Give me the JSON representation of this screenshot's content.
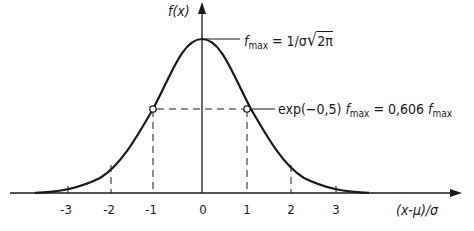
{
  "diagram": {
    "y_axis_label": "f(x)",
    "x_axis_label": "(x-μ)/σ",
    "x_ticks": [
      "-3",
      "-2",
      "-1",
      "0",
      "1",
      "2",
      "3"
    ],
    "annotations": {
      "peak": {
        "prefix": "f",
        "sub": "max",
        "rest": "= 1/σ",
        "sqrt": "2π"
      },
      "inflection": {
        "text1": "exp(−0,5)",
        "f1": "f",
        "sub1": "max",
        "mid": "= 0,606",
        "f2": "f",
        "sub2": "max"
      }
    },
    "colors": {
      "line": "#1a1a1a",
      "background": "#ffffff"
    }
  }
}
